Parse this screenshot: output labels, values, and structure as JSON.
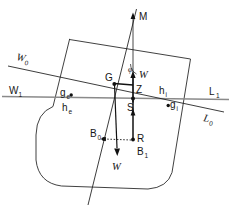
{
  "figure": {
    "kind": "ship-stability-diagram",
    "background_color": "#ffffff",
    "width": 231,
    "height": 215
  },
  "colors": {
    "hull_stroke": "#2b2b2b",
    "waterline_upright": "#8a8a8a",
    "waterline_heeled": "#1a1a1a",
    "centerline": "#1a1a1a",
    "force_arrow": "#111111",
    "dotted_link": "#333333",
    "text": "#161616"
  },
  "labels": {
    "metacentre": "M",
    "centre_of_gravity": "G",
    "point_z": "Z",
    "point_s": "S",
    "point_r": "R",
    "buoyancy_upright": "B",
    "buoyancy_heeled": "B",
    "weight_force": "W",
    "buoyancy_force": "W",
    "heel_angle": "φ",
    "waterline_heeled_left": "W",
    "waterline_upright_left": "W",
    "waterline_upright_right": "L",
    "waterline_heeled_right": "L",
    "emerged_wedge_centroid": "g",
    "immersed_wedge_centroid": "g",
    "emerged_wedge_lever": "h",
    "immersed_wedge_lever": "h"
  },
  "subscripts": {
    "b_upright": "0",
    "b_heeled": "1",
    "w_heeled": "0",
    "w_upright": "1",
    "l_upright": "1",
    "l_heeled": "0",
    "g_emerged": "e",
    "g_immersed": "i",
    "h_emerged": "e",
    "h_immersed": "i"
  },
  "annotations": {
    "note_vertical_up_arrow": "buoyancy-force-up",
    "note_vertical_down_arrow": "weight-force-down",
    "note_dotted": "B0-to-R horizontal shift"
  },
  "geometry": {
    "heel_angle_degrees": 9,
    "hull_rotation_degrees": 9
  }
}
